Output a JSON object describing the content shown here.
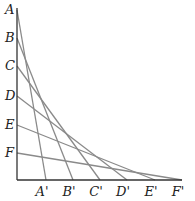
{
  "diagram": {
    "type": "line-envelope",
    "origin": {
      "x": 17,
      "y": 180
    },
    "y_axis_top": 8,
    "x_axis_right": 182,
    "y_points": [
      {
        "label": "A",
        "y": 10
      },
      {
        "label": "B",
        "y": 38
      },
      {
        "label": "C",
        "y": 66
      },
      {
        "label": "D",
        "y": 96
      },
      {
        "label": "E",
        "y": 125
      },
      {
        "label": "F",
        "y": 153
      }
    ],
    "x_points": [
      {
        "label": "A'",
        "x": 46
      },
      {
        "label": "B'",
        "x": 73
      },
      {
        "label": "C'",
        "x": 100
      },
      {
        "label": "D'",
        "x": 127
      },
      {
        "label": "E'",
        "x": 155
      },
      {
        "label": "F'",
        "x": 182
      }
    ],
    "segments": [
      {
        "from": "A",
        "to": "A'"
      },
      {
        "from": "B",
        "to": "B'"
      },
      {
        "from": "C",
        "to": "C'"
      },
      {
        "from": "D",
        "to": "D'"
      },
      {
        "from": "E",
        "to": "E'"
      },
      {
        "from": "F",
        "to": "F'"
      }
    ],
    "colors": {
      "axis": "#333333",
      "segment": "#8a8a8a",
      "label": "#222222"
    }
  }
}
